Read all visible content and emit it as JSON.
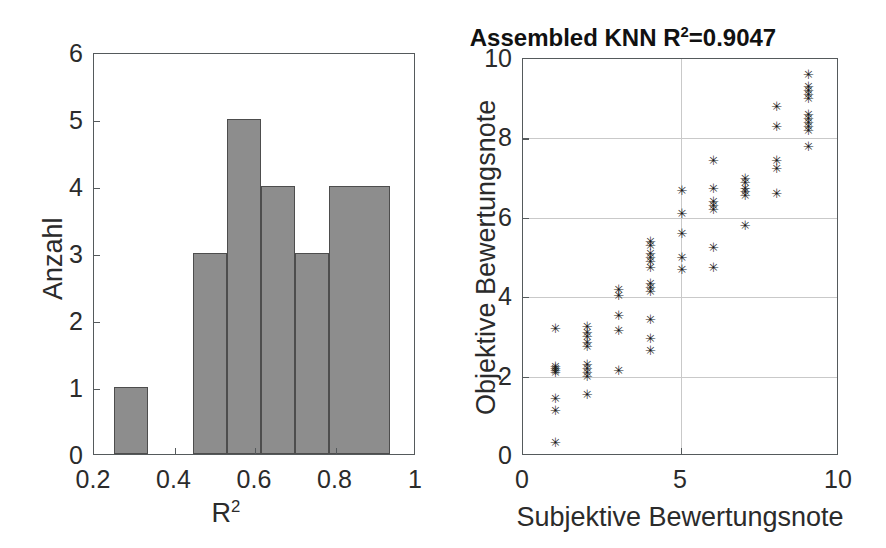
{
  "figure": {
    "background": "#ffffff",
    "bar_fill": "#8d8d8d",
    "bar_edge": "#4d4d4d",
    "axis_color": "#555a5c",
    "grid_color": "#c9c9c9",
    "marker_color": "#1a1a1a"
  },
  "left_panel": {
    "name": "histogram-panel",
    "xlabel_base": "R",
    "xlabel_sup": "2",
    "ylabel": "Anzahl",
    "xticks": [
      "0.2",
      "0.4",
      "0.6",
      "0.8",
      "1"
    ],
    "yticks": [
      "0",
      "1",
      "2",
      "3",
      "4",
      "5",
      "6"
    ]
  },
  "right_panel": {
    "name": "scatter-panel",
    "title_base": "Assembled KNN R",
    "title_sup": "2",
    "title_tail": "=0.9047",
    "title_full": "Assembled KNN R2=0.9047",
    "xlabel": "Subjektive Bewertungsnote",
    "ylabel": "Objektive Bewertungsnote",
    "xticks": [
      "0",
      "5",
      "10"
    ],
    "yticks": [
      "0",
      "2",
      "4",
      "6",
      "8",
      "10"
    ]
  },
  "chart_data": [
    {
      "type": "bar",
      "id": "histogram-r2",
      "title": "",
      "xlabel": "R^2",
      "ylabel": "Anzahl",
      "xlim": [
        0.2,
        1.0
      ],
      "ylim": [
        0,
        6
      ],
      "grid": false,
      "xticks": [
        0.2,
        0.4,
        0.6,
        0.8,
        1.0
      ],
      "yticks": [
        0,
        1,
        2,
        3,
        4,
        5,
        6
      ],
      "bin_edges": [
        0.25,
        0.335,
        0.445,
        0.53,
        0.615,
        0.7,
        0.785,
        0.855,
        0.935
      ],
      "bins": [
        {
          "left": 0.25,
          "right": 0.335,
          "count": 1
        },
        {
          "left": 0.445,
          "right": 0.53,
          "count": 3
        },
        {
          "left": 0.53,
          "right": 0.615,
          "count": 5
        },
        {
          "left": 0.615,
          "right": 0.7,
          "count": 4
        },
        {
          "left": 0.7,
          "right": 0.785,
          "count": 3
        },
        {
          "left": 0.785,
          "right": 0.935,
          "count": 4
        }
      ],
      "categories": [
        "0.25-0.34",
        "0.45-0.53",
        "0.53-0.62",
        "0.62-0.70",
        "0.70-0.79",
        "0.79-0.94"
      ],
      "values": [
        1,
        3,
        5,
        4,
        3,
        4
      ]
    },
    {
      "type": "scatter",
      "id": "assembled-knn-scatter",
      "title": "Assembled KNN R^2=0.9047",
      "xlabel": "Subjektive Bewertungsnote",
      "ylabel": "Objektive Bewertungsnote",
      "xlim": [
        0,
        10
      ],
      "ylim": [
        0,
        10
      ],
      "grid": true,
      "xticks": [
        0,
        5,
        10
      ],
      "yticks": [
        0,
        2,
        4,
        6,
        8,
        10
      ],
      "marker": "*",
      "r2": 0.9047,
      "points": [
        [
          1,
          0.35
        ],
        [
          1,
          1.15
        ],
        [
          1,
          1.45
        ],
        [
          1,
          2.1
        ],
        [
          1,
          2.15
        ],
        [
          1,
          2.2
        ],
        [
          1,
          2.25
        ],
        [
          1,
          3.2
        ],
        [
          2,
          1.55
        ],
        [
          2,
          2.0
        ],
        [
          2,
          2.1
        ],
        [
          2,
          2.2
        ],
        [
          2,
          2.3
        ],
        [
          2,
          2.75
        ],
        [
          2,
          2.85
        ],
        [
          2,
          3.0
        ],
        [
          2,
          3.1
        ],
        [
          2,
          3.25
        ],
        [
          3,
          2.15
        ],
        [
          3,
          3.15
        ],
        [
          3,
          3.55
        ],
        [
          3,
          4.05
        ],
        [
          3,
          4.2
        ],
        [
          4,
          2.65
        ],
        [
          4,
          2.95
        ],
        [
          4,
          3.45
        ],
        [
          4,
          4.15
        ],
        [
          4,
          4.25
        ],
        [
          4,
          4.35
        ],
        [
          4,
          4.75
        ],
        [
          4,
          4.9
        ],
        [
          4,
          5.0
        ],
        [
          4,
          5.1
        ],
        [
          4,
          5.3
        ],
        [
          4,
          5.4
        ],
        [
          5,
          4.7
        ],
        [
          5,
          5.0
        ],
        [
          5,
          5.6
        ],
        [
          5,
          6.1
        ],
        [
          5,
          6.7
        ],
        [
          6,
          4.75
        ],
        [
          6,
          5.25
        ],
        [
          6,
          6.2
        ],
        [
          6,
          6.3
        ],
        [
          6,
          6.4
        ],
        [
          6,
          6.75
        ],
        [
          6,
          7.45
        ],
        [
          7,
          5.8
        ],
        [
          7,
          6.55
        ],
        [
          7,
          6.65
        ],
        [
          7,
          6.75
        ],
        [
          7,
          6.9
        ],
        [
          7,
          7.0
        ],
        [
          8,
          6.6
        ],
        [
          8,
          7.25
        ],
        [
          8,
          7.45
        ],
        [
          8,
          8.3
        ],
        [
          8,
          8.8
        ],
        [
          9,
          7.8
        ],
        [
          9,
          8.2
        ],
        [
          9,
          8.3
        ],
        [
          9,
          8.4
        ],
        [
          9,
          8.5
        ],
        [
          9,
          8.6
        ],
        [
          9,
          9.0
        ],
        [
          9,
          9.1
        ],
        [
          9,
          9.2
        ],
        [
          9,
          9.3
        ],
        [
          9,
          9.6
        ]
      ]
    }
  ]
}
